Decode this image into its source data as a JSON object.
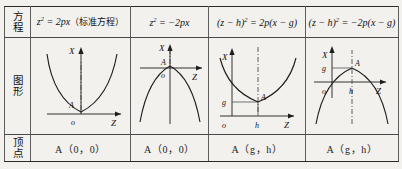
{
  "table": {
    "rows": {
      "equation_label": {
        "line1": "方",
        "line2": "程"
      },
      "figure_label": {
        "line1": "图",
        "line2": "形"
      },
      "vertex_label": {
        "line1": "顶",
        "line2": "点"
      }
    },
    "columns": [
      {
        "equation": {
          "lhs_base": "z",
          "lhs_exp": "2",
          "rhs": "= 2px",
          "note": "（标准方程）"
        },
        "vertex": "A（0，0）",
        "figure": {
          "direction": "opens-up",
          "x_axis_label": "X",
          "z_axis_label": "Z",
          "origin_label": "o",
          "vertex_label": "A",
          "g_label": "",
          "h_label": "",
          "axis_of_symmetry": "vertical-dashed"
        }
      },
      {
        "equation": {
          "lhs_base": "z",
          "lhs_exp": "2",
          "rhs": "= −2px",
          "note": ""
        },
        "vertex": "A（0，0）",
        "figure": {
          "direction": "opens-down",
          "x_axis_label": "X",
          "z_axis_label": "Z",
          "origin_label": "o",
          "vertex_label": "A",
          "g_label": "",
          "h_label": "",
          "axis_of_symmetry": "vertical-dashed"
        }
      },
      {
        "equation": {
          "lhs_base": "(z − h)",
          "lhs_exp": "2",
          "rhs": "= 2p(x − g)",
          "note": ""
        },
        "vertex": "A（g，h）",
        "figure": {
          "direction": "opens-up",
          "x_axis_label": "X",
          "z_axis_label": "Z",
          "origin_label": "o",
          "vertex_label": "A",
          "g_label": "g",
          "h_label": "h",
          "axis_of_symmetry": "vertical-dashed"
        }
      },
      {
        "equation": {
          "lhs_base": "(z − h)",
          "lhs_exp": "2",
          "rhs": "= −2p(x − g)",
          "note": ""
        },
        "vertex": "A（g，h）",
        "figure": {
          "direction": "opens-down",
          "x_axis_label": "X",
          "z_axis_label": "Z",
          "origin_label": "o",
          "vertex_label": "A",
          "g_label": "g",
          "h_label": "h",
          "axis_of_symmetry": "vertical-dashed"
        }
      }
    ]
  },
  "colors": {
    "page_background": "#f3f1ee",
    "rule_strong": "#2b2b2b",
    "rule_light": "#4a4a4a",
    "ink": "#1b1b1b"
  }
}
